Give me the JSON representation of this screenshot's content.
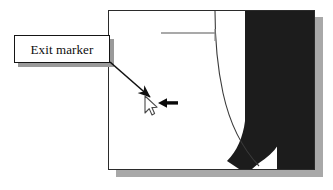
{
  "figure": {
    "width": 333,
    "height": 190,
    "background": "#ffffff"
  },
  "callout": {
    "label": "Exit marker",
    "border_color": "#151515",
    "fill_color": "#ffffff",
    "shadow_color": "#9a9a9a",
    "text_color": "#0d0d0d"
  },
  "leader": {
    "name": "leader-arrow",
    "from_x": 110,
    "from_y": 62,
    "to_x": 152,
    "to_y": 99,
    "color": "#111111"
  },
  "panel": {
    "border_color": "#2b2b2b",
    "fill_color": "#ffffff",
    "shadow_color": "#a8a8a8",
    "dark_region_color": "#1c1c1c",
    "gray_band_color": "#7b7b7b",
    "wedge_color": "#c2c2c2",
    "guide_line_color": "#8d8d8d",
    "curve_color": "#3a3a3a"
  },
  "cursor": {
    "name": "mouse-pointer",
    "x": 145,
    "y": 96,
    "outline_color": "#4a4a4a",
    "fill_color": "#ffffff"
  },
  "pointing_arrow": {
    "name": "exit-marker-arrow",
    "direction": "left",
    "x": 158,
    "y": 103,
    "length": 20,
    "color": "#0a0a0a"
  }
}
